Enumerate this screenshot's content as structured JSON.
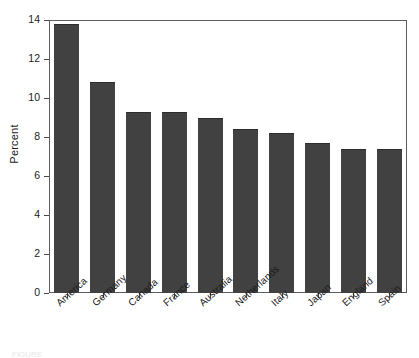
{
  "chart_data": {
    "type": "bar",
    "title": "",
    "xlabel": "",
    "ylabel": "Percent",
    "ylim": [
      0,
      14
    ],
    "yticks": [
      0,
      2,
      4,
      6,
      8,
      10,
      12,
      14
    ],
    "ytick_labels": [
      "0",
      "2",
      "4",
      "6",
      "8",
      "10",
      "12",
      "14"
    ],
    "grid": false,
    "legend": false,
    "bar_color": "#414141",
    "frame": true,
    "categories": [
      "America",
      "Germany",
      "Canada",
      "France",
      "Australia",
      "Netherlands",
      "Italy",
      "Japan",
      "England",
      "Spain"
    ],
    "values": [
      13.8,
      10.8,
      9.3,
      9.3,
      9.0,
      8.4,
      8.2,
      7.7,
      7.4,
      7.4
    ]
  },
  "caption": {
    "fragment": "FIGURE"
  }
}
